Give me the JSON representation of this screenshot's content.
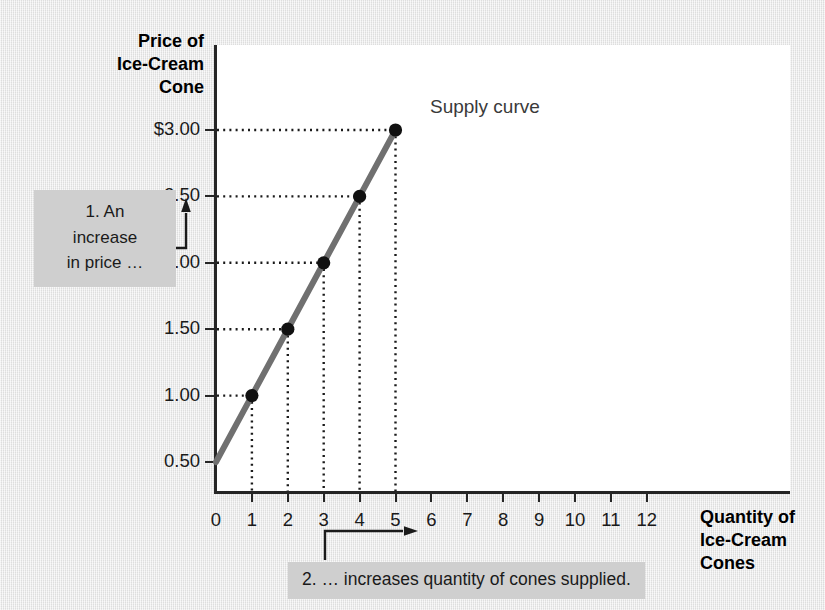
{
  "figure": {
    "background_color": "#e9e9e9",
    "plot_background_color": "#ffffff",
    "axis_color": "#262626"
  },
  "axis_titles": {
    "y_line_1": "Price of",
    "y_line_2": "Ice-Cream",
    "y_line_3": "Cone",
    "x_line_1": "Quantity of",
    "x_line_2": "Ice-Cream Cones"
  },
  "series_label": "Supply curve",
  "annotations": {
    "annotation_1_line_1": "1. An",
    "annotation_1_line_2": "increase",
    "annotation_1_line_3": "in price …",
    "annotation_2": "2. … increases quantity of cones supplied."
  },
  "chart_data": {
    "type": "line",
    "title": "",
    "subtitle": "",
    "xlabel": "Quantity of Ice-Cream Cones",
    "ylabel": "Price of Ice-Cream Cone",
    "xlim": [
      0,
      12
    ],
    "ylim": [
      0,
      3.25
    ],
    "grid": false,
    "legend_position": "inline-right",
    "x_tick_labels": [
      "0",
      "1",
      "2",
      "3",
      "4",
      "5",
      "6",
      "7",
      "8",
      "9",
      "10",
      "11",
      "12"
    ],
    "x_tick_values": [
      0,
      1,
      2,
      3,
      4,
      5,
      6,
      7,
      8,
      9,
      10,
      11,
      12
    ],
    "y_tick_labels": [
      "$3.00",
      "2.50",
      "2.00",
      "1.50",
      "1.00",
      "0.50"
    ],
    "y_tick_values": [
      3.0,
      2.5,
      2.0,
      1.5,
      1.0,
      0.5
    ],
    "series": [
      {
        "name": "Supply curve",
        "color": "#707070",
        "line_width": 6,
        "marker": "filled-circle",
        "marker_color": "#111111",
        "x": [
          0,
          1,
          2,
          3,
          4,
          5
        ],
        "y": [
          0.5,
          1.0,
          1.5,
          2.0,
          2.5,
          3.0
        ]
      }
    ],
    "data_points": [
      {
        "quantity": 1,
        "price": 1.0
      },
      {
        "quantity": 2,
        "price": 1.5
      },
      {
        "quantity": 3,
        "price": 2.0
      },
      {
        "quantity": 4,
        "price": 2.5
      },
      {
        "quantity": 5,
        "price": 3.0
      }
    ],
    "guide_lines": "dotted leaders from each point to both axes",
    "annotations": [
      "1. An increase in price …",
      "2. … increases quantity of cones supplied."
    ]
  }
}
